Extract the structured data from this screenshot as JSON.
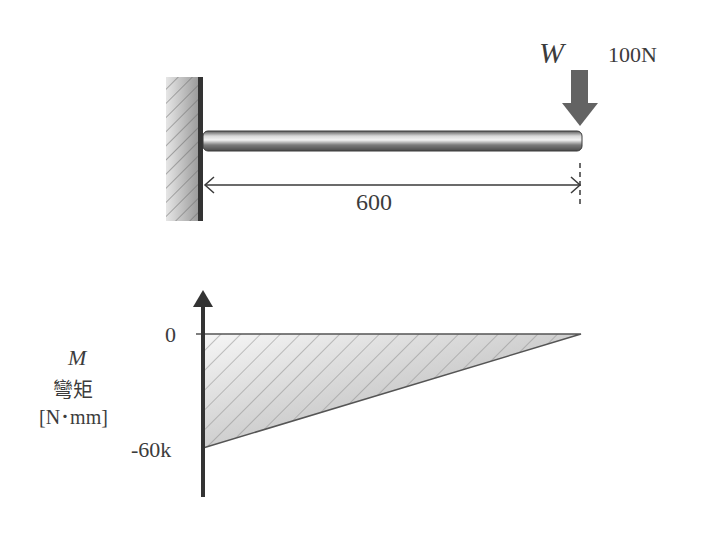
{
  "beam": {
    "load_symbol": "W",
    "load_value": "100N",
    "length_label": "600"
  },
  "moment_diagram": {
    "ylabel_symbol": "M",
    "ylabel_name": "彎矩",
    "ylabel_unit": "[N･mm]",
    "tick_zero": "0",
    "tick_min": "-60k"
  },
  "colors": {
    "line": "#3a3a3a",
    "arrow": "#606060",
    "fill": "#d8d8d8"
  }
}
